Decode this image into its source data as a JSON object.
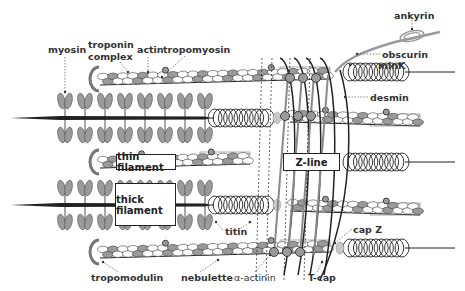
{
  "labels": {
    "myosin": "myosin",
    "troponin_complex_line1": "troponin",
    "troponin_complex_line2": "complex",
    "actin": "actin",
    "tropomyosin": "tropomyosin",
    "ankyrin": "ankyrin",
    "obscurin": "obscurin",
    "mink": "minK",
    "desmin": "desmin",
    "titin": "titin",
    "cap_z": "cap Z",
    "tropomodulin": "tropomodulin",
    "nebulette": "nebulette",
    "alpha_actinin": "α-actinin",
    "t_cap": "T-cap"
  },
  "boxes": {
    "thin_filament": "thin filament",
    "thick_filament": "thick filament",
    "z_line": "Z-line"
  },
  "colors": {
    "ink": "#222222",
    "protein_gray": "#9a9a9a",
    "light_gray": "#c8c8c8",
    "label_text": "#333333"
  }
}
